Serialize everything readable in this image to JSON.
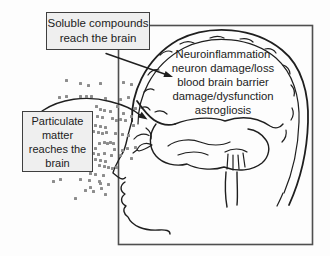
{
  "canvas": {
    "width": 330,
    "height": 256,
    "background": "#fdfdfd"
  },
  "styles": {
    "line_color": "#1f1f1f",
    "frame_color": "#4f4f4f",
    "box_fill": "#efefef",
    "box_border": "#3f3f3f",
    "text_color": "#1c1c1c",
    "particle_color": "#8d8d8d"
  },
  "callouts": {
    "soluble": {
      "lines": [
        "Soluble compounds",
        "reach the brain"
      ]
    },
    "particulate": {
      "lines": [
        "Particulate",
        "matter",
        "reaches the",
        "brain"
      ]
    }
  },
  "brain_label": {
    "lines": [
      "Neuroinflammation",
      "neuron damage/loss",
      "blood brain barrier",
      "damage/dysfunction",
      "astrogliosis"
    ]
  },
  "particles": {
    "size": 3,
    "points": [
      [
        66,
        80
      ],
      [
        80,
        83
      ],
      [
        88,
        85
      ],
      [
        100,
        83
      ],
      [
        123,
        82
      ],
      [
        131,
        84
      ],
      [
        59,
        97
      ],
      [
        66,
        96
      ],
      [
        80,
        96
      ],
      [
        86,
        96
      ],
      [
        91,
        96
      ],
      [
        105,
        98
      ],
      [
        120,
        99
      ],
      [
        128,
        97
      ],
      [
        96,
        106
      ],
      [
        100,
        109
      ],
      [
        104,
        110
      ],
      [
        110,
        111
      ],
      [
        117,
        106
      ],
      [
        123,
        113
      ],
      [
        135,
        108
      ],
      [
        90,
        114
      ],
      [
        97,
        116
      ],
      [
        102,
        117
      ],
      [
        112,
        118
      ],
      [
        116,
        120
      ],
      [
        120,
        119
      ],
      [
        125,
        120
      ],
      [
        131,
        116
      ],
      [
        95,
        125
      ],
      [
        100,
        126
      ],
      [
        105,
        127
      ],
      [
        133,
        125
      ],
      [
        80,
        130
      ],
      [
        89,
        130
      ],
      [
        93,
        131
      ],
      [
        98,
        132
      ],
      [
        102,
        133
      ],
      [
        106,
        132
      ],
      [
        115,
        133
      ],
      [
        122,
        134
      ],
      [
        128,
        135
      ],
      [
        99,
        143
      ],
      [
        104,
        142
      ],
      [
        107,
        143
      ],
      [
        110,
        142
      ],
      [
        113,
        143
      ],
      [
        95,
        148
      ],
      [
        114,
        149
      ],
      [
        122,
        150
      ],
      [
        127,
        148
      ],
      [
        135,
        147
      ],
      [
        93,
        153
      ],
      [
        98,
        154
      ],
      [
        104,
        153
      ],
      [
        111,
        155
      ],
      [
        120,
        155
      ],
      [
        95,
        159
      ],
      [
        100,
        160
      ],
      [
        105,
        161
      ],
      [
        131,
        158
      ],
      [
        99,
        165
      ],
      [
        104,
        166
      ],
      [
        108,
        167
      ],
      [
        112,
        168
      ],
      [
        116,
        167
      ],
      [
        90,
        173
      ],
      [
        95,
        174
      ],
      [
        103,
        175
      ],
      [
        53,
        181
      ],
      [
        60,
        179
      ],
      [
        80,
        179
      ],
      [
        89,
        180
      ],
      [
        99,
        181
      ],
      [
        100,
        183
      ],
      [
        108,
        184
      ],
      [
        85,
        190
      ],
      [
        90,
        187
      ],
      [
        93,
        191
      ],
      [
        101,
        188
      ],
      [
        105,
        194
      ],
      [
        75,
        198
      ]
    ]
  }
}
